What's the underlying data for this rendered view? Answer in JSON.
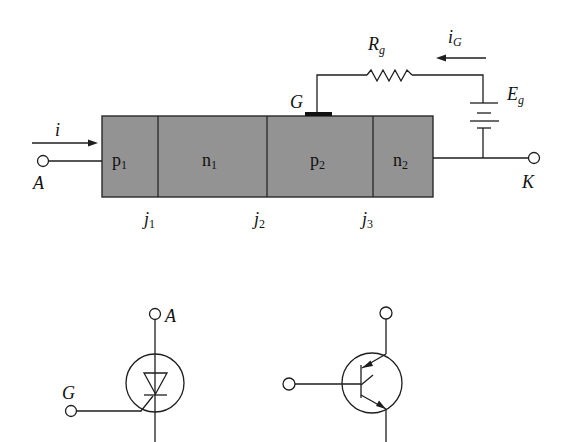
{
  "figure": {
    "colors": {
      "semiconductor_fill": "#939393",
      "line": "#1e1e1e",
      "background": "#ffffff"
    }
  },
  "structure": {
    "regions": [
      {
        "name": "p",
        "sub": "1"
      },
      {
        "name": "n",
        "sub": "1"
      },
      {
        "name": "p",
        "sub": "2"
      },
      {
        "name": "n",
        "sub": "2"
      }
    ],
    "junctions": [
      {
        "name": "j",
        "sub": "1"
      },
      {
        "name": "j",
        "sub": "2"
      },
      {
        "name": "j",
        "sub": "3"
      }
    ],
    "anode_label": "A",
    "cathode_label": "K",
    "gate_label": "G",
    "current_label": "i",
    "gate_current": {
      "name": "i",
      "sub": "G"
    },
    "gate_resistor": {
      "name": "R",
      "sub": "g"
    },
    "gate_source": {
      "name": "E",
      "sub": "g"
    }
  },
  "symbols": {
    "thyristor": {
      "anode_label": "A",
      "gate_label": "G"
    },
    "transistor_equivalent": {}
  }
}
